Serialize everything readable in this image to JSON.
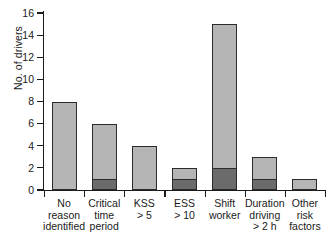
{
  "chart_data": {
    "type": "bar",
    "stacked": true,
    "title": "",
    "xlabel": "",
    "ylabel": "No. of drivers",
    "ylim": [
      0,
      16
    ],
    "yticks": [
      0,
      2,
      4,
      6,
      8,
      10,
      12,
      14,
      16
    ],
    "ytick_labels": [
      "0",
      "2",
      "4",
      "6",
      "8",
      "10",
      "12",
      "14",
      "16"
    ],
    "grid": false,
    "legend": "none",
    "categories": [
      "No reason identified",
      "Critical time period",
      "KSS > 5",
      "ESS > 10",
      "Shift worker",
      "Duration driving > 2 h",
      "Other risk factors"
    ],
    "category_lines": [
      [
        "No",
        "reason",
        "identified"
      ],
      [
        "Critical",
        "time",
        "period"
      ],
      [
        "KSS",
        "> 5"
      ],
      [
        "ESS",
        "> 10"
      ],
      [
        "Shift",
        "worker"
      ],
      [
        "Duration",
        "driving",
        "> 2 h"
      ],
      [
        "Other",
        "risk",
        "factors"
      ]
    ],
    "series": [
      {
        "name": "dark-segment",
        "color": "#6b6b6b",
        "values": [
          0,
          1,
          0,
          1,
          2,
          1,
          0
        ]
      },
      {
        "name": "light-segment",
        "color": "#b5b5b5",
        "values": [
          8,
          5,
          4,
          1,
          13,
          2,
          1
        ]
      }
    ],
    "totals": [
      8,
      6,
      4,
      2,
      15,
      3,
      1
    ]
  },
  "colors": {
    "light_fill": "#b5b5b5",
    "dark_fill": "#6b6b6b",
    "outline": "#2b2b2b",
    "axis": "#1a1a1a",
    "background": "#ffffff"
  }
}
